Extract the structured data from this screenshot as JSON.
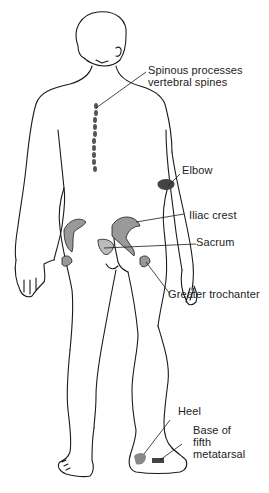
{
  "diagram": {
    "labels": [
      {
        "id": "spinous",
        "lines": [
          "Spinous processes",
          "vertebral spines"
        ]
      },
      {
        "id": "elbow",
        "lines": [
          "Elbow"
        ]
      },
      {
        "id": "iliac",
        "lines": [
          "Iliac crest"
        ]
      },
      {
        "id": "sacrum",
        "lines": [
          "Sacrum"
        ]
      },
      {
        "id": "trochanter",
        "lines": [
          "Greater trochanter"
        ]
      },
      {
        "id": "heel",
        "lines": [
          "Heel"
        ]
      },
      {
        "id": "metatarsal",
        "lines": [
          "Base of",
          "fifth",
          "metatarsal"
        ]
      }
    ],
    "colors": {
      "line": "#1a1a1a",
      "shade": "#888888",
      "background": "#ffffff"
    }
  }
}
